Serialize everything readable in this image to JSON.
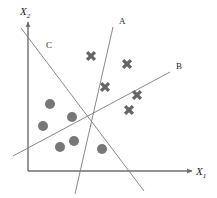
{
  "figure": {
    "width": 217,
    "height": 198,
    "background": "#ffffff"
  },
  "axes": {
    "x_label": "X",
    "x_subscript": "1",
    "y_label": "X",
    "y_subscript": "2",
    "color": "#6e6e6e",
    "origin": [
      28,
      171
    ],
    "x_end": [
      192,
      171
    ],
    "y_end": [
      28,
      22
    ]
  },
  "boundaries": [
    {
      "name": "A",
      "label": "A",
      "label_pos": [
        119,
        17
      ],
      "x1": 113,
      "y1": 27,
      "x2": 75,
      "y2": 194,
      "color": "#7a7a7a"
    },
    {
      "name": "B",
      "label": "B",
      "label_pos": [
        176,
        62
      ],
      "x1": 13,
      "y1": 156,
      "x2": 170,
      "y2": 72,
      "color": "#7a7a7a"
    },
    {
      "name": "C",
      "label": "C",
      "label_pos": [
        46,
        41
      ],
      "x1": 21,
      "y1": 28,
      "x2": 144,
      "y2": 191,
      "color": "#7a7a7a"
    }
  ],
  "chart_data": {
    "type": "scatter",
    "title": "",
    "xlabel": "X1",
    "ylabel": "X2",
    "grid": false,
    "legend_position": "none",
    "series": [
      {
        "name": "circles",
        "marker": "circle",
        "color": "#777777",
        "radius": 5,
        "points": [
          [
            50,
            104
          ],
          [
            72,
            117
          ],
          [
            43,
            126
          ],
          [
            60,
            147
          ],
          [
            74,
            141
          ],
          [
            102,
            149
          ]
        ]
      },
      {
        "name": "crosses",
        "marker": "x",
        "color": "#666666",
        "size": 11,
        "points": [
          [
            91,
            56
          ],
          [
            127,
            64
          ],
          [
            105,
            87
          ],
          [
            137,
            95
          ],
          [
            129,
            110
          ]
        ]
      }
    ]
  }
}
